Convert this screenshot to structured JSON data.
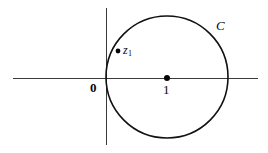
{
  "figure": {
    "kind": "complex-plane-diagram",
    "width": 268,
    "height": 153,
    "background_color": "#ffffff",
    "stroke_color": "#111111",
    "axis_color": "#3a3a3a"
  },
  "axes": {
    "horizontal": {
      "name": "real-axis",
      "y": 78,
      "x_start": 13,
      "x_end": 258
    },
    "vertical": {
      "name": "imaginary-axis",
      "x": 106,
      "y_start": 8,
      "y_end": 145
    }
  },
  "circle": {
    "label": "C",
    "center_x": 167,
    "center_y": 77,
    "radius": 61,
    "stroke_width": 1.6,
    "description": "circle tangent to the imaginary axis at the origin"
  },
  "points": [
    {
      "name": "origin",
      "label": "0",
      "label_x": 90,
      "label_y": 81,
      "dot": false
    },
    {
      "name": "center",
      "label": "1",
      "dot_x": 167,
      "dot_y": 78,
      "dot_r": 3,
      "label_x": 163,
      "label_y": 83,
      "dot": true
    },
    {
      "name": "z1",
      "label_main": "z",
      "label_sub": "1",
      "dot_x": 118,
      "dot_y": 51,
      "dot_r": 2.4,
      "label_x": 123,
      "label_y": 44,
      "dot": true
    }
  ],
  "annotations": {
    "contour_label": "C",
    "contour_label_x": 216,
    "contour_label_y": 19
  }
}
